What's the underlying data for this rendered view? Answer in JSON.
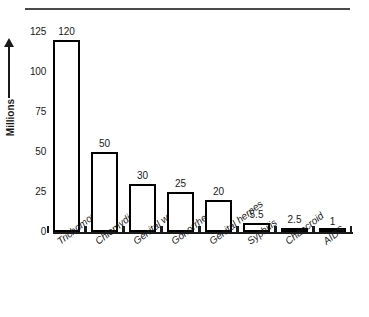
{
  "figure": {
    "top_rule": "horizontal-rule",
    "background_color": "#ffffff",
    "ink_color": "#1a1a1a"
  },
  "chart_data": {
    "type": "bar",
    "title": "",
    "subtitle": "",
    "xlabel": "",
    "ylabel": "Millions",
    "ylim": [
      0,
      125
    ],
    "yticks": [
      0,
      25,
      50,
      75,
      100,
      125
    ],
    "ytick_labels": [
      "0",
      "25",
      "50",
      "75",
      "100",
      "125"
    ],
    "grid": false,
    "legend": false,
    "legend_position": "none",
    "orientation": "vertical",
    "bar_fill_color": "#ffffff",
    "bar_edge_color": "#000000",
    "categories": [
      "Trichomoniasis",
      "Chlamydia",
      "Genital warts",
      "Gonorrhea",
      "Genital herpes",
      "Syphilis",
      "Chancroid",
      "AIDS"
    ],
    "values": [
      120,
      50,
      30,
      25,
      20,
      5.5,
      2.5,
      1
    ],
    "value_labels": [
      "120",
      "50",
      "30",
      "25",
      "20",
      "5.5",
      "2.5",
      "1"
    ],
    "annotations": [
      "y-axis arrow pointing up beside the Millions label"
    ]
  }
}
